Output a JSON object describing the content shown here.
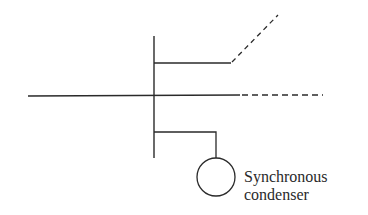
{
  "diagram": {
    "type": "single-line power system diagram",
    "stroke_color": "#2a2a2a",
    "background": "#ffffff",
    "elements": {
      "bus": {
        "description": "vertical bus bar"
      },
      "upper_feeder": {
        "description": "branch line continuing as dashed diagonal"
      },
      "main_line": {
        "description": "horizontal transmission line continuing dashed"
      },
      "condenser_branch": {
        "description": "branch connecting to synchronous condenser"
      },
      "condenser": {
        "symbol": "circle",
        "label_line1": "Synchronous",
        "label_line2": "condenser"
      }
    }
  }
}
